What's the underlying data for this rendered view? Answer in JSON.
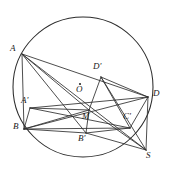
{
  "figure": {
    "kind": "euclidean-geometry-diagram",
    "width": 169,
    "height": 175,
    "background_color": "#ffffff",
    "stroke_color": "#2b2b2b",
    "label_color": "#1a1a1a"
  },
  "circle": {
    "name": "main-circle",
    "center_label": "O",
    "cx": 83,
    "cy": 87,
    "r": 70,
    "stroke_width": 1.05
  },
  "center_marker": {
    "name": "center-dot",
    "cx": 80,
    "cy": 84,
    "r": 1.1
  },
  "points": [
    {
      "id": "A",
      "label": "A",
      "x": 22,
      "y": 54,
      "label_x": 10,
      "label_y": 44,
      "on_circle": true
    },
    {
      "id": "B",
      "label": "B",
      "x": 24,
      "y": 129,
      "label_x": 13,
      "label_y": 122,
      "on_circle": true
    },
    {
      "id": "D",
      "label": "D",
      "x": 148,
      "y": 97,
      "label_x": 153,
      "label_y": 89,
      "on_circle": true
    },
    {
      "id": "Bp",
      "label": "B'",
      "x": 86,
      "y": 133,
      "label_x": 78,
      "label_y": 134,
      "on_circle": true
    },
    {
      "id": "S",
      "label": "S",
      "x": 146,
      "y": 150,
      "label_x": 146,
      "label_y": 151,
      "on_circle": false
    },
    {
      "id": "Ap",
      "label": "A'",
      "x": 30,
      "y": 108,
      "label_x": 21,
      "label_y": 96,
      "on_circle": false
    },
    {
      "id": "Dp",
      "label": "D'",
      "x": 101,
      "y": 77,
      "label_x": 93,
      "label_y": 62,
      "on_circle": false
    },
    {
      "id": "Cp",
      "label": "C'",
      "x": 130,
      "y": 128,
      "label_x": 123,
      "label_y": 112,
      "on_circle": false
    },
    {
      "id": "M",
      "label": "M",
      "x": 89,
      "y": 110,
      "label_x": 82,
      "label_y": 112,
      "on_circle": false
    },
    {
      "id": "O",
      "label": "O",
      "x": 80,
      "y": 84,
      "label_x": 76,
      "label_y": 85,
      "on_circle": false
    }
  ],
  "segments": [
    {
      "name": "segment-A-B",
      "from": "A",
      "to": "B"
    },
    {
      "name": "segment-A-D",
      "from": "A",
      "to": "D"
    },
    {
      "name": "segment-A-M",
      "from": "A",
      "to": "M"
    },
    {
      "name": "segment-A-Bp",
      "from": "A",
      "to": "Bp"
    },
    {
      "name": "segment-A-S",
      "from": "A",
      "to": "S"
    },
    {
      "name": "segment-Ap-M",
      "from": "Ap",
      "to": "M"
    },
    {
      "name": "segment-Ap-B",
      "from": "Ap",
      "to": "B"
    },
    {
      "name": "segment-Ap-Cp",
      "from": "Ap",
      "to": "Cp"
    },
    {
      "name": "segment-Ap-D",
      "from": "Ap",
      "to": "D"
    },
    {
      "name": "segment-B-M",
      "from": "B",
      "to": "M"
    },
    {
      "name": "segment-B-D",
      "from": "B",
      "to": "D"
    },
    {
      "name": "segment-B-Bp",
      "from": "B",
      "to": "Bp"
    },
    {
      "name": "segment-B-Cp",
      "from": "B",
      "to": "Cp"
    },
    {
      "name": "segment-M-Dp",
      "from": "M",
      "to": "Dp"
    },
    {
      "name": "segment-M-Bp",
      "from": "M",
      "to": "Bp"
    },
    {
      "name": "segment-M-S",
      "from": "M",
      "to": "S"
    },
    {
      "name": "segment-Dp-D",
      "from": "Dp",
      "to": "D"
    },
    {
      "name": "segment-Dp-Cp",
      "from": "Dp",
      "to": "Cp"
    },
    {
      "name": "segment-Dp-S",
      "from": "Dp",
      "to": "S"
    },
    {
      "name": "segment-D-Cp",
      "from": "D",
      "to": "Cp"
    },
    {
      "name": "segment-D-S",
      "from": "D",
      "to": "S"
    },
    {
      "name": "segment-Bp-S",
      "from": "Bp",
      "to": "S"
    },
    {
      "name": "segment-Bp-Cp",
      "from": "Bp",
      "to": "Cp"
    }
  ]
}
